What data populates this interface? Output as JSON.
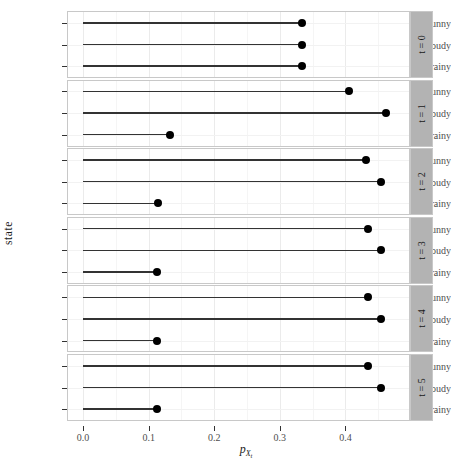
{
  "chart_data": {
    "type": "bar",
    "subtype": "lollipop-faceted-horizontal",
    "title": "",
    "xlabel": "p_{X_t}",
    "xlabel_parts": {
      "base": "p",
      "sub": "X",
      "sub2": "t"
    },
    "ylabel": "state",
    "categories": [
      "sunny",
      "cloudy",
      "rainy"
    ],
    "xlim": [
      -0.023,
      0.497
    ],
    "xticks": [
      0.0,
      0.1,
      0.2,
      0.3,
      0.4
    ],
    "xticklabels": [
      "0.0",
      "0.1",
      "0.2",
      "0.3",
      "0.4"
    ],
    "xminorticks": [
      0.05,
      0.15,
      0.25,
      0.35,
      0.45
    ],
    "grid": true,
    "legend": null,
    "facet_var": "t",
    "facet_label_prefix": "t =",
    "facets": [
      {
        "label": "t = 0",
        "t": 0,
        "values": {
          "sunny": 0.3333,
          "cloudy": 0.3333,
          "rainy": 0.3333
        }
      },
      {
        "label": "t = 1",
        "t": 1,
        "values": {
          "sunny": 0.405,
          "cloudy": 0.462,
          "rainy": 0.133
        }
      },
      {
        "label": "t = 2",
        "t": 2,
        "values": {
          "sunny": 0.431,
          "cloudy": 0.454,
          "rainy": 0.115
        }
      },
      {
        "label": "t = 3",
        "t": 3,
        "values": {
          "sunny": 0.434,
          "cloudy": 0.454,
          "rainy": 0.112
        }
      },
      {
        "label": "t = 4",
        "t": 4,
        "values": {
          "sunny": 0.434,
          "cloudy": 0.454,
          "rainy": 0.112
        }
      },
      {
        "label": "t = 5",
        "t": 5,
        "values": {
          "sunny": 0.434,
          "cloudy": 0.454,
          "rainy": 0.112
        }
      }
    ],
    "colors": {
      "point": "#000000",
      "segment": "#333333",
      "panel_background": "#ffffff",
      "panel_border": "#c8c8c8",
      "grid_major": "#ebebeb",
      "grid_minor": "#f5f5f5",
      "strip_background": "#b3b3b3",
      "text": "#4d4d4d"
    }
  }
}
